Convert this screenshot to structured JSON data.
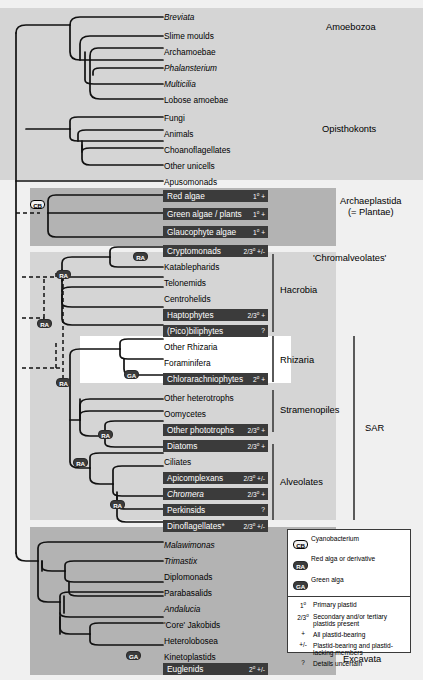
{
  "diagram": {
    "colors": {
      "page_background": "#ffffff",
      "canvas_background": "#f0f0f0",
      "band_dark": "#b3b3b3",
      "band_light": "#d5d5d5",
      "label_bar": "#3b3b3b",
      "label_bar_text": "#ffffff",
      "branch_line": "#111111",
      "group_rule": "#5a5a5a"
    }
  },
  "taxa": {
    "amoebozoa": [
      {
        "name": "Breviata",
        "italic": true,
        "bar": false,
        "annotation": ""
      },
      {
        "name": "Slime moulds",
        "italic": false,
        "bar": false,
        "annotation": ""
      },
      {
        "name": "Archamoebae",
        "italic": false,
        "bar": false,
        "annotation": ""
      },
      {
        "name": "Phalansterium",
        "italic": true,
        "bar": false,
        "annotation": ""
      },
      {
        "name": "Multicilia",
        "italic": true,
        "bar": false,
        "annotation": ""
      },
      {
        "name": "Lobose amoebae",
        "italic": false,
        "bar": false,
        "annotation": ""
      }
    ],
    "opisthokonts": [
      {
        "name": "Fungi",
        "italic": false,
        "bar": false,
        "annotation": ""
      },
      {
        "name": "Animals",
        "italic": false,
        "bar": false,
        "annotation": ""
      },
      {
        "name": "Choanoflagellates",
        "italic": false,
        "bar": false,
        "annotation": ""
      },
      {
        "name": "Other unicells",
        "italic": false,
        "bar": false,
        "annotation": ""
      }
    ],
    "apusomonads": [
      {
        "name": "Apusomonads",
        "italic": false,
        "bar": false,
        "annotation": ""
      }
    ],
    "archaeplastida": [
      {
        "name": "Red algae",
        "italic": false,
        "bar": true,
        "annotation": "1° +"
      },
      {
        "name": "Green algae / plants",
        "italic": false,
        "bar": true,
        "annotation": "1° +"
      },
      {
        "name": "Glaucophyte algae",
        "italic": false,
        "bar": true,
        "annotation": "1° +"
      }
    ],
    "hacrobia": [
      {
        "name": "Cryptomonads",
        "italic": false,
        "bar": true,
        "annotation": "2/3° +/-"
      },
      {
        "name": "Katablepharids",
        "italic": false,
        "bar": false,
        "annotation": ""
      },
      {
        "name": "Telonemids",
        "italic": false,
        "bar": false,
        "annotation": ""
      },
      {
        "name": "Centrohelids",
        "italic": false,
        "bar": false,
        "annotation": ""
      },
      {
        "name": "Haptophytes",
        "italic": false,
        "bar": true,
        "annotation": "2/3° +"
      },
      {
        "name": "(Pico)biliphytes",
        "italic": false,
        "bar": true,
        "annotation": "?"
      }
    ],
    "rhizaria": [
      {
        "name": "Other Rhizaria",
        "italic": false,
        "bar": false,
        "annotation": ""
      },
      {
        "name": "Foraminifera",
        "italic": false,
        "bar": false,
        "annotation": ""
      },
      {
        "name": "Chlorarachniophytes",
        "italic": false,
        "bar": true,
        "annotation": "2° +"
      }
    ],
    "stramenopiles": [
      {
        "name": "Other heterotrophs",
        "italic": false,
        "bar": false,
        "annotation": ""
      },
      {
        "name": "Oomycetes",
        "italic": false,
        "bar": false,
        "annotation": ""
      },
      {
        "name": "Other phototrophs",
        "italic": false,
        "bar": true,
        "annotation": "2/3° +"
      },
      {
        "name": "Diatoms",
        "italic": false,
        "bar": true,
        "annotation": "2/3° +"
      }
    ],
    "alveolates": [
      {
        "name": "Ciliates",
        "italic": false,
        "bar": false,
        "annotation": ""
      },
      {
        "name": "Apicomplexans",
        "italic": false,
        "bar": true,
        "annotation": "2/3° +/-"
      },
      {
        "name": "Chromera",
        "italic": true,
        "bar": true,
        "annotation": "2/3° +"
      },
      {
        "name": "Perkinsids",
        "italic": false,
        "bar": true,
        "annotation": "?"
      },
      {
        "name": "Dinoflagellates*",
        "italic": false,
        "bar": true,
        "annotation": "2/3° +/-"
      }
    ],
    "excavata": [
      {
        "name": "Malawimonas",
        "italic": true,
        "bar": false,
        "annotation": ""
      },
      {
        "name": "Trimastix",
        "italic": true,
        "bar": false,
        "annotation": ""
      },
      {
        "name": "Diplomonads",
        "italic": false,
        "bar": false,
        "annotation": ""
      },
      {
        "name": "Parabasalids",
        "italic": false,
        "bar": false,
        "annotation": ""
      },
      {
        "name": "Andalucia",
        "italic": true,
        "bar": false,
        "annotation": ""
      },
      {
        "name": "'Core' Jakobids",
        "italic": false,
        "bar": false,
        "annotation": ""
      },
      {
        "name": "Heterolobosea",
        "italic": false,
        "bar": false,
        "annotation": ""
      },
      {
        "name": "Kinetoplastids",
        "italic": false,
        "bar": false,
        "annotation": ""
      },
      {
        "name": "Euglenids",
        "italic": false,
        "bar": true,
        "annotation": "2° +/-"
      }
    ]
  },
  "group_labels": {
    "amoebozoa": "Amoebozoa",
    "opisthokonts": "Opisthokonts",
    "archaeplastida_line1": "Archaeplastida",
    "archaeplastida_line2": "(= Plantae)",
    "chromalveolates": "'Chromalveolates'",
    "hacrobia": "Hacrobia",
    "rhizaria": "Rhizaria",
    "stramenopiles": "Stramenopiles",
    "alveolates": "Alveolates",
    "sar": "SAR",
    "excavata": "Excavata"
  },
  "endosymbiont_nodes": [
    {
      "id": "cb-archaeplastida",
      "label": "CB",
      "style": "open"
    },
    {
      "id": "ra-cryptomonads",
      "label": "RA",
      "style": "dark"
    },
    {
      "id": "ra-hacrobia",
      "label": "RA",
      "style": "dark"
    },
    {
      "id": "ra-chromalveolate",
      "label": "RA",
      "style": "dark"
    },
    {
      "id": "ga-chlorarachniophytes",
      "label": "GA",
      "style": "dark"
    },
    {
      "id": "ra-sar",
      "label": "RA",
      "style": "dark"
    },
    {
      "id": "ra-stramenopiles",
      "label": "RA",
      "style": "dark"
    },
    {
      "id": "ra-stramenopile-phototrophs",
      "label": "RA",
      "style": "dark"
    },
    {
      "id": "ra-alveolates",
      "label": "RA",
      "style": "dark"
    },
    {
      "id": "ga-euglenids",
      "label": "GA",
      "style": "dark"
    }
  ],
  "legend": {
    "organisms": [
      {
        "badge": "CB",
        "style": "open",
        "text": "Cyanobacterium"
      },
      {
        "badge": "RA",
        "style": "dark",
        "text": "Red alga or derivative"
      },
      {
        "badge": "GA",
        "style": "dark",
        "text": "Green alga"
      }
    ],
    "symbols": [
      {
        "symbol": "1°",
        "text": "Primary plastid"
      },
      {
        "symbol": "2/3°",
        "text": "Secondary and/or tertiary plastids present"
      },
      {
        "symbol": "+",
        "text": "All plastid-bearing"
      },
      {
        "symbol": "+/-",
        "text": "Plastid-bearing and plastid-lacking members"
      },
      {
        "symbol": "?",
        "text": "Details uncertain"
      }
    ]
  }
}
